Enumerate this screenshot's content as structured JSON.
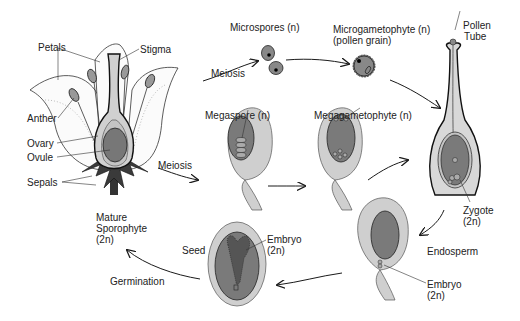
{
  "diagram": {
    "labels": {
      "petals": "Petals",
      "stigma": "Stigma",
      "anther": "Anther",
      "ovary": "Ovary",
      "ovule": "Ovule",
      "sepals": "Sepals",
      "meiosis_top": "Meiosis",
      "meiosis_mid": "Meiosis",
      "microspores": "Microspores (n)",
      "microgametophyte_line1": "Microgametophyte (n)",
      "microgametophyte_line2": "(pollen grain)",
      "pollen_tube_line1": "Pollen",
      "pollen_tube_line2": "Tube",
      "megaspore": "Megaspore (n)",
      "megagametophyte": "Megagametophyte (n)",
      "zygote_line1": "Zygote",
      "zygote_line2": "(2n)",
      "endosperm": "Endosperm",
      "embryo_right_line1": "Embryo",
      "embryo_right_line2": "(2n)",
      "seed": "Seed",
      "embryo_seed_line1": "Embryo",
      "embryo_seed_line2": "(2n)",
      "mature_line1": "Mature",
      "mature_line2": "Sporophyte",
      "mature_line3": "(2n)",
      "germination": "Germination"
    },
    "colors": {
      "outline": "#1a1a1a",
      "integument": "#cfcfcf",
      "nucellus": "#7a7a7a",
      "sepal": "#3a3a3a",
      "petal_fill": "#fbfbfb",
      "stipple": "#bdbdbd"
    }
  }
}
